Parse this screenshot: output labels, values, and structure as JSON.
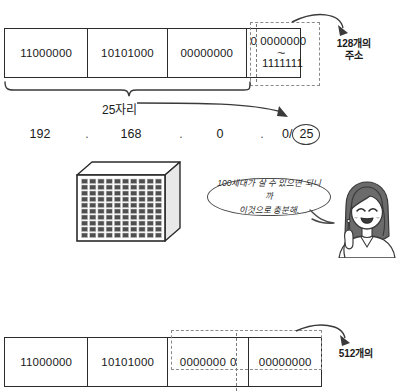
{
  "diagram": {
    "top": {
      "octets": [
        {
          "bits": "11000000"
        },
        {
          "bits": "10101000"
        },
        {
          "bits": "00000000"
        }
      ],
      "range_cell": {
        "fixed_bit": "0",
        "range_top": "0000000",
        "squiggle": "~",
        "range_bottom": "1111111"
      },
      "callout": "128개의\n주소",
      "brace_label": "25자리",
      "ip": {
        "octet1": "192",
        "octet2": "168",
        "octet3": "0",
        "octet4": "0/",
        "prefix": "25",
        "separator": "."
      }
    },
    "middle": {
      "building": {
        "columns": 10,
        "rows": 10,
        "window_color": "#4f4f4f",
        "face_color": "#ffffff"
      },
      "speech": {
        "line1": "100세대가 살 수 있으면 되니까",
        "line2": "이것으로 충분해."
      },
      "character": {
        "name": "smiling-woman-pointing-up",
        "hair_color": "#5a5a5a",
        "skin_color": "#ffffff"
      }
    },
    "bottom": {
      "octets": [
        {
          "bits": "11000000"
        },
        {
          "bits": "10101000"
        }
      ],
      "split_cell": {
        "left_bits": "0000000",
        "right_bit": "0"
      },
      "last_cell": {
        "bits": "00000000"
      },
      "callout": "512개의"
    }
  },
  "colors": {
    "stroke": "#2b2b2b",
    "dash": "#8a8a8a",
    "text": "#1a1a1a",
    "window": "#4f4f4f",
    "background": "#ffffff"
  }
}
